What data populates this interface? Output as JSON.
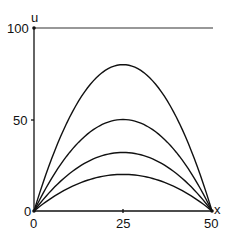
{
  "chart_data": {
    "type": "line",
    "title": "",
    "xlabel": "x",
    "ylabel": "u",
    "xlim": [
      0,
      50
    ],
    "ylim": [
      0,
      100
    ],
    "x_ticks": [
      0,
      25,
      50
    ],
    "x_tick_labels": [
      "0",
      "25",
      "50"
    ],
    "y_ticks": [
      0,
      50,
      100
    ],
    "y_tick_labels": [
      "0",
      "50",
      "100"
    ],
    "grid": false,
    "legend": null,
    "annotations": [
      "horizontal line at u = 100 from x = 0 to x = 50"
    ],
    "series": [
      {
        "name": "curve-1",
        "shape": "parabola",
        "x": [
          0,
          12.5,
          25,
          37.5,
          50
        ],
        "values": [
          0,
          60,
          80,
          60,
          0
        ]
      },
      {
        "name": "curve-2",
        "shape": "parabola",
        "x": [
          0,
          12.5,
          25,
          37.5,
          50
        ],
        "values": [
          0,
          38,
          50,
          38,
          0
        ]
      },
      {
        "name": "curve-3",
        "shape": "parabola",
        "x": [
          0,
          12.5,
          25,
          37.5,
          50
        ],
        "values": [
          0,
          24,
          32,
          24,
          0
        ]
      },
      {
        "name": "curve-4",
        "shape": "parabola",
        "x": [
          0,
          12.5,
          25,
          37.5,
          50
        ],
        "values": [
          0,
          15,
          20,
          15,
          0
        ]
      }
    ],
    "boundary_line": {
      "u": 100,
      "x": [
        0,
        50
      ]
    }
  },
  "labels": {
    "y_axis": "u",
    "x_axis": "x",
    "y100": "100",
    "y50": "50",
    "y0": "0",
    "x0": "0",
    "x25": "25",
    "x50": "50"
  }
}
